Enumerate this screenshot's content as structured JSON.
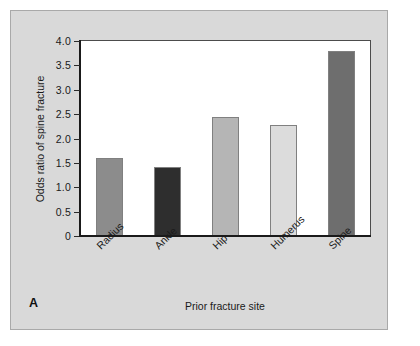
{
  "figure": {
    "panel_label": "A",
    "background_color": "#d9d9d9",
    "plot_background_color": "#ffffff",
    "frame_color": "#4c4c4c"
  },
  "chart_data": {
    "type": "bar",
    "title": "",
    "subtitle": "",
    "xlabel": "Prior fracture site",
    "ylabel": "Odds ratio of spine fracture",
    "categories": [
      "Radius",
      "Ankle",
      "Hip",
      "Humerus",
      "Spine"
    ],
    "values": [
      1.6,
      1.42,
      2.45,
      2.27,
      3.8
    ],
    "bar_colors": [
      "#8c8c8c",
      "#2e2e2e",
      "#b5b5b5",
      "#dcdcdc",
      "#6e6e6e"
    ],
    "ylim": [
      0,
      4.0
    ],
    "ytick_values": [
      0,
      0.5,
      1.0,
      1.5,
      2.0,
      2.5,
      3.0,
      3.5,
      4.0
    ],
    "ytick_labels": [
      "0",
      "0.5",
      "1.0",
      "1.5",
      "2.0",
      "2.5",
      "3.0",
      "3.5",
      "4.0"
    ],
    "grid": false,
    "legend": null,
    "legend_position": "none",
    "annotations": [
      "A"
    ],
    "xtick_rotation_deg": -45
  }
}
